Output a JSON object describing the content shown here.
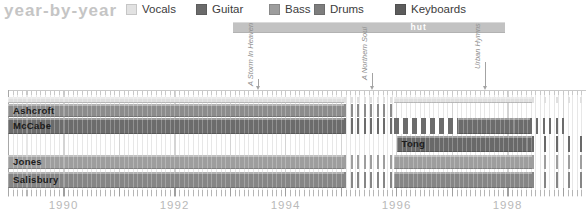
{
  "title": "year-by-year",
  "legend": [
    {
      "label": "Vocals",
      "color": "#e2e2e2",
      "x": 126
    },
    {
      "label": "Guitar",
      "color": "#6a6a6a",
      "x": 196
    },
    {
      "label": "Bass",
      "color": "#9d9d9d",
      "x": 269
    },
    {
      "label": "Drums",
      "color": "#7d7d7d",
      "x": 314
    },
    {
      "label": "Keyboards",
      "color": "#5c5c5c",
      "x": 395
    }
  ],
  "record_label_span": {
    "label": "hut",
    "start_year": 1993.05,
    "end_year": 1997.95,
    "label_center_year": 1996.4,
    "color": "#c2c2c2"
  },
  "albums": [
    {
      "title": "A Storm In Heaven",
      "year": 1993.5,
      "line_top": 79
    },
    {
      "title": "A Northern Soul",
      "year": 1995.55,
      "line_top": 73
    },
    {
      "title": "Urban Hymns",
      "year": 1997.6,
      "line_top": 62
    }
  ],
  "chart_data": {
    "type": "timeline",
    "title": "year-by-year",
    "axis": {
      "start_year": 1989.0,
      "end_year": 1999.45,
      "px_per_year": 55.5,
      "left_px": 8,
      "minor_tick_interval_months": 1,
      "year_labels": [
        "1990",
        "1992",
        "1994",
        "1996",
        "1998"
      ]
    },
    "members": [
      {
        "name": "Ashcroft",
        "lanes": [
          {
            "color": "#e0e0e0",
            "y": 97,
            "height": 6,
            "show_label": false,
            "segments": [
              {
                "start": 1989.0,
                "end": 1995.05,
                "style": "solid"
              },
              {
                "start": 1995.05,
                "end": 1995.95,
                "style": "dashed"
              },
              {
                "start": 1995.95,
                "end": 1998.45,
                "style": "solid"
              },
              {
                "start": 1998.45,
                "end": 1999.4,
                "style": "sparse"
              }
            ]
          },
          {
            "color": "#8c8c8c",
            "y": 104,
            "height": 13,
            "show_label": true,
            "segments": [
              {
                "start": 1989.0,
                "end": 1995.05,
                "style": "solid"
              },
              {
                "start": 1995.05,
                "end": 1995.95,
                "style": "dashed"
              }
            ]
          }
        ]
      },
      {
        "name": "McCabe",
        "lanes": [
          {
            "color": "#6c6c6c",
            "y": 118,
            "height": 16,
            "show_label": true,
            "segments": [
              {
                "start": 1989.0,
                "end": 1995.05,
                "style": "solid"
              },
              {
                "start": 1995.05,
                "end": 1995.95,
                "style": "dashed"
              },
              {
                "start": 1995.95,
                "end": 1997.1,
                "style": "striped"
              },
              {
                "start": 1997.1,
                "end": 1998.4,
                "style": "solid"
              },
              {
                "start": 1998.4,
                "end": 1999.05,
                "style": "dashed"
              }
            ]
          }
        ]
      },
      {
        "name": "Tong",
        "lanes": [
          {
            "color": "#696969",
            "y": 136,
            "height": 16,
            "show_label": true,
            "segments": [
              {
                "start": 1996.0,
                "end": 1998.45,
                "style": "solid"
              },
              {
                "start": 1998.45,
                "end": 1999.4,
                "style": "sparse"
              }
            ]
          }
        ]
      },
      {
        "name": "Jones",
        "lanes": [
          {
            "color": "#9e9e9e",
            "y": 155,
            "height": 14,
            "show_label": true,
            "segments": [
              {
                "start": 1989.0,
                "end": 1995.05,
                "style": "solid"
              },
              {
                "start": 1995.05,
                "end": 1995.95,
                "style": "dashed"
              },
              {
                "start": 1995.95,
                "end": 1998.45,
                "style": "solid"
              },
              {
                "start": 1998.45,
                "end": 1999.4,
                "style": "sparse"
              }
            ]
          }
        ]
      },
      {
        "name": "Salisbury",
        "lanes": [
          {
            "color": "#868686",
            "y": 172,
            "height": 16,
            "show_label": true,
            "segments": [
              {
                "start": 1989.0,
                "end": 1995.05,
                "style": "solid"
              },
              {
                "start": 1995.05,
                "end": 1995.95,
                "style": "dashed"
              },
              {
                "start": 1995.95,
                "end": 1998.45,
                "style": "solid"
              },
              {
                "start": 1998.45,
                "end": 1999.4,
                "style": "sparse"
              }
            ]
          }
        ]
      }
    ]
  }
}
